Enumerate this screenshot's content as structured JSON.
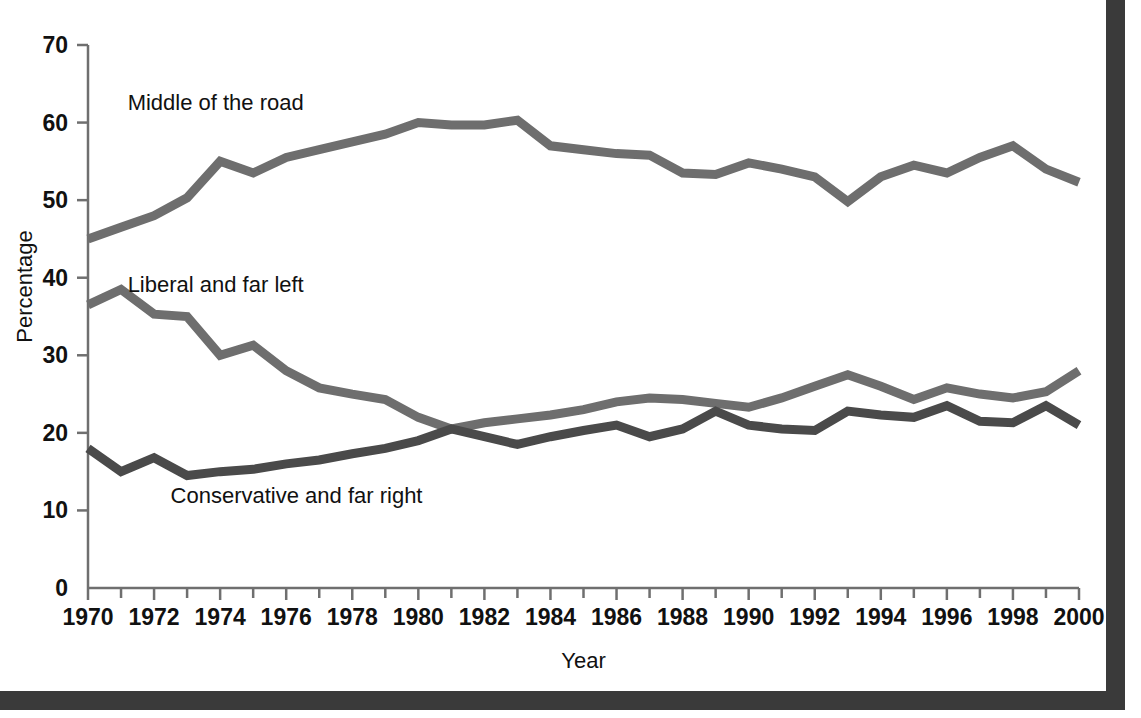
{
  "chart_data": {
    "type": "line",
    "title": "",
    "xlabel": "Year",
    "ylabel": "Percentage",
    "xlim": [
      1970,
      2000
    ],
    "ylim": [
      0,
      70
    ],
    "ytick_step": 10,
    "xtick_step": 1,
    "xticklabel_step": 2,
    "grid": false,
    "legend_position": "inline-annotations",
    "yticks": [
      "0",
      "10",
      "20",
      "30",
      "40",
      "50",
      "60",
      "70"
    ],
    "xticks": [
      "1970",
      "1972",
      "1974",
      "1976",
      "1978",
      "1980",
      "1982",
      "1984",
      "1986",
      "1988",
      "1990",
      "1992",
      "1994",
      "1996",
      "1998",
      "2000"
    ],
    "x": [
      1970,
      1971,
      1972,
      1973,
      1974,
      1975,
      1976,
      1977,
      1978,
      1979,
      1980,
      1981,
      1982,
      1983,
      1984,
      1985,
      1986,
      1987,
      1988,
      1989,
      1990,
      1991,
      1992,
      1993,
      1994,
      1995,
      1996,
      1997,
      1998,
      1999,
      2000
    ],
    "series": [
      {
        "name": "Middle of the road",
        "color": "#6e6e6e",
        "label_x": 1971.2,
        "label_y": 62.5,
        "values": [
          45.0,
          46.5,
          48.0,
          50.3,
          55.0,
          53.5,
          55.5,
          56.5,
          57.5,
          58.5,
          60.0,
          59.7,
          59.7,
          60.3,
          57.0,
          56.5,
          56.0,
          55.8,
          53.5,
          53.3,
          54.8,
          54.0,
          53.0,
          49.8,
          53.0,
          54.5,
          53.5,
          55.5,
          57.0,
          54.0,
          52.3
        ]
      },
      {
        "name": "Liberal and far left",
        "color": "#6e6e6e",
        "label_x": 1971.2,
        "label_y": 39.0,
        "values": [
          36.5,
          38.5,
          35.3,
          35.0,
          30.0,
          31.3,
          28.0,
          25.8,
          25.0,
          24.3,
          22.0,
          20.5,
          21.3,
          21.8,
          22.3,
          23.0,
          24.0,
          24.5,
          24.3,
          23.8,
          23.3,
          24.5,
          26.0,
          27.5,
          26.0,
          24.3,
          25.8,
          25.0,
          24.5,
          25.3,
          28.0
        ]
      },
      {
        "name": "Conservative and far right",
        "color": "#4a4a4a",
        "label_x": 1972.5,
        "label_y": 11.8,
        "values": [
          18.0,
          15.0,
          16.8,
          14.5,
          15.0,
          15.3,
          16.0,
          16.5,
          17.3,
          18.0,
          19.0,
          20.5,
          19.5,
          18.5,
          19.5,
          20.3,
          21.0,
          19.5,
          20.5,
          22.8,
          21.0,
          20.5,
          20.3,
          22.8,
          22.3,
          22.0,
          23.5,
          21.5,
          21.3,
          23.5,
          21.0
        ]
      }
    ]
  },
  "axes": {
    "y_title": "Percentage",
    "x_title": "Year"
  }
}
